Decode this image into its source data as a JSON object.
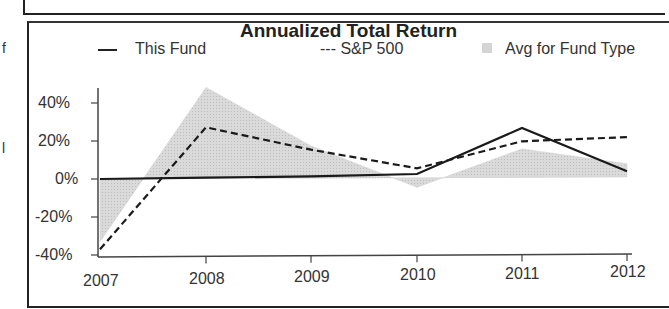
{
  "margin_fragments": [
    "f",
    "l"
  ],
  "chart_data": {
    "type": "line",
    "title": "Annualized Total Return",
    "xlabel": "",
    "ylabel": "",
    "categories": [
      "2007",
      "2008",
      "2009",
      "2010",
      "2011",
      "2012"
    ],
    "yticks": [
      "40%",
      "20%",
      "0%",
      "-20%",
      "-40%"
    ],
    "ylim": [
      -40,
      50
    ],
    "grid": false,
    "legend_position": "top",
    "series": [
      {
        "name": "This Fund",
        "style": "solid",
        "color": "#222222",
        "values": [
          0,
          0.5,
          1,
          2,
          26,
          3
        ]
      },
      {
        "name": "S&P 500",
        "style": "dashed",
        "color": "#222222",
        "values": [
          -37,
          27,
          15,
          5,
          19,
          21
        ]
      },
      {
        "name": "Avg for Fund Type",
        "style": "area",
        "color": "#d4d4d4",
        "values": [
          -33,
          48,
          17,
          -5,
          15,
          7
        ]
      }
    ]
  },
  "legend": {
    "this_fund": "This Fund",
    "sp500": "--- S&P 500",
    "avg": "Avg for Fund Type"
  }
}
